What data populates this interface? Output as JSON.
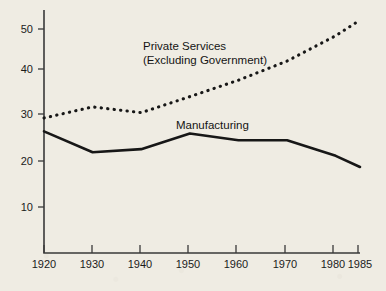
{
  "chart_data": {
    "type": "line",
    "title": "",
    "subtitle": "",
    "xlabel": "",
    "ylabel": "",
    "xlim": [
      1920,
      1985
    ],
    "ylim": [
      0,
      55
    ],
    "grid": false,
    "legend_position": "inline-annotations",
    "x_tick_labels": [
      "1920",
      "1930",
      "1940",
      "1950",
      "1960",
      "1970",
      "1980",
      "1985"
    ],
    "x_ticks": [
      1920,
      1930,
      1940,
      1950,
      1960,
      1970,
      1980,
      1985
    ],
    "y_tick_labels": [
      "10",
      "20",
      "30",
      "40",
      "50"
    ],
    "y_ticks": [
      10,
      20,
      30,
      40,
      50
    ],
    "series": [
      {
        "name": "Private Services (Excluding Government)",
        "style": "dotted",
        "label_line_1": "Private Services",
        "label_line_2": "(Excluding Government)",
        "x": [
          1920,
          1930,
          1940,
          1950,
          1960,
          1970,
          1980,
          1985
        ],
        "values": [
          30.0,
          32.5,
          31.2,
          34.8,
          38.5,
          42.8,
          48.5,
          52.0
        ]
      },
      {
        "name": "Manufacturing",
        "style": "solid",
        "label_line_1": "Manufacturing",
        "label_line_2": "",
        "x": [
          1920,
          1930,
          1940,
          1950,
          1960,
          1970,
          1980,
          1985
        ],
        "values": [
          27.0,
          22.3,
          23.0,
          26.5,
          25.0,
          25.0,
          21.5,
          19.0
        ]
      }
    ],
    "annotations": [
      {
        "text": "Private Services",
        "x": 1940,
        "y": 46.5
      },
      {
        "text": "(Excluding Government)",
        "x": 1940,
        "y": 44.0
      },
      {
        "text": "Manufacturing",
        "x": 1948,
        "y": 29.8
      }
    ],
    "colors": {
      "background": "#efece3",
      "ink": "#171717",
      "axis": "#3a3a3a"
    }
  }
}
